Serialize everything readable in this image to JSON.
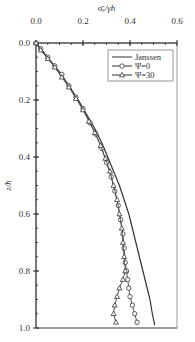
{
  "chart_data": {
    "type": "line",
    "title": "",
    "xlabel": "σ̄ᵥ/γh",
    "ylabel": "z/h",
    "xlim": [
      0.0,
      0.6
    ],
    "ylim": [
      0.0,
      1.0
    ],
    "y_inverted": true,
    "x_axis_position": "top",
    "x_ticks": [
      "0.0",
      "0.2",
      "0.4",
      "0.6"
    ],
    "y_ticks": [
      "0.0",
      "0.2",
      "0.4",
      "0.6",
      "0.8",
      "1.0"
    ],
    "grid": false,
    "legend_position": "upper right",
    "series": [
      {
        "name": "Janssen",
        "marker": "none",
        "points": [
          [
            0.0,
            0.0
          ],
          [
            0.05,
            0.05
          ],
          [
            0.095,
            0.1
          ],
          [
            0.14,
            0.15
          ],
          [
            0.18,
            0.2
          ],
          [
            0.215,
            0.25
          ],
          [
            0.25,
            0.3
          ],
          [
            0.28,
            0.35
          ],
          [
            0.305,
            0.4
          ],
          [
            0.33,
            0.45
          ],
          [
            0.355,
            0.5
          ],
          [
            0.375,
            0.55
          ],
          [
            0.395,
            0.6
          ],
          [
            0.41,
            0.65
          ],
          [
            0.425,
            0.7
          ],
          [
            0.44,
            0.75
          ],
          [
            0.455,
            0.8
          ],
          [
            0.47,
            0.85
          ],
          [
            0.485,
            0.9
          ],
          [
            0.495,
            0.95
          ],
          [
            0.505,
            0.99
          ]
        ]
      },
      {
        "name": "Ψ=0",
        "marker": "circle",
        "points": [
          [
            0.0,
            0.0
          ],
          [
            0.02,
            0.02
          ],
          [
            0.05,
            0.05
          ],
          [
            0.08,
            0.08
          ],
          [
            0.11,
            0.11
          ],
          [
            0.14,
            0.15
          ],
          [
            0.17,
            0.19
          ],
          [
            0.2,
            0.23
          ],
          [
            0.23,
            0.28
          ],
          [
            0.255,
            0.32
          ],
          [
            0.28,
            0.37
          ],
          [
            0.3,
            0.42
          ],
          [
            0.32,
            0.47
          ],
          [
            0.335,
            0.52
          ],
          [
            0.35,
            0.57
          ],
          [
            0.36,
            0.62
          ],
          [
            0.37,
            0.67
          ],
          [
            0.375,
            0.72
          ],
          [
            0.38,
            0.77
          ],
          [
            0.385,
            0.8
          ],
          [
            0.39,
            0.83
          ],
          [
            0.395,
            0.86
          ],
          [
            0.4,
            0.89
          ],
          [
            0.41,
            0.92
          ],
          [
            0.42,
            0.95
          ],
          [
            0.43,
            0.98
          ]
        ]
      },
      {
        "name": "Ψ=30",
        "marker": "triangle",
        "points": [
          [
            0.0,
            0.0
          ],
          [
            0.02,
            0.025
          ],
          [
            0.05,
            0.055
          ],
          [
            0.08,
            0.085
          ],
          [
            0.11,
            0.12
          ],
          [
            0.14,
            0.155
          ],
          [
            0.17,
            0.195
          ],
          [
            0.2,
            0.235
          ],
          [
            0.225,
            0.275
          ],
          [
            0.25,
            0.315
          ],
          [
            0.275,
            0.36
          ],
          [
            0.295,
            0.405
          ],
          [
            0.315,
            0.45
          ],
          [
            0.33,
            0.5
          ],
          [
            0.345,
            0.55
          ],
          [
            0.355,
            0.6
          ],
          [
            0.365,
            0.65
          ],
          [
            0.37,
            0.7
          ],
          [
            0.375,
            0.75
          ],
          [
            0.38,
            0.8
          ],
          [
            0.37,
            0.83
          ],
          [
            0.355,
            0.86
          ],
          [
            0.345,
            0.89
          ],
          [
            0.335,
            0.92
          ],
          [
            0.33,
            0.95
          ],
          [
            0.34,
            0.98
          ]
        ]
      }
    ]
  },
  "labels": {
    "xlabel": "σ̄ᵥ/γh",
    "ylabel": "z/h",
    "legend": [
      "Janssen",
      "Ψ=0",
      "Ψ=30"
    ]
  }
}
